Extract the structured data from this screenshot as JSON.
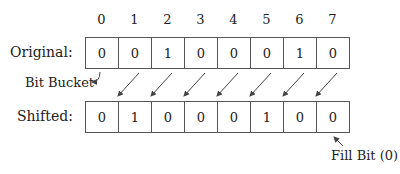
{
  "indices": [
    "0",
    "1",
    "2",
    "3",
    "4",
    "5",
    "6",
    "7"
  ],
  "original": {
    "label": "Original:",
    "bits": [
      "0",
      "0",
      "1",
      "0",
      "0",
      "0",
      "1",
      "0"
    ]
  },
  "shifted": {
    "label": "Shifted:",
    "bits": [
      "0",
      "1",
      "0",
      "0",
      "0",
      "1",
      "0",
      "0"
    ]
  },
  "annotations": {
    "bit_bucket": "Bit Bucket",
    "fill_bit": "Fill Bit (0)"
  }
}
